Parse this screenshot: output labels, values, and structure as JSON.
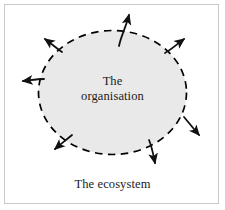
{
  "figure": {
    "name": "organisation-ecosystem-diagram",
    "background_color": "#ffffff",
    "frame_color": "#c9c9c9"
  },
  "organisation": {
    "label_line_1": "The",
    "label_line_2": "organisation",
    "fill_color": "#e9e9e9",
    "boundary_color": "#000000",
    "boundary_style": "dashed"
  },
  "ecosystem": {
    "label": "The ecosystem"
  },
  "arrows": {
    "color": "#111111",
    "count": 7,
    "items": [
      {
        "id": "arrow-top",
        "direction": "up"
      },
      {
        "id": "arrow-upper-left",
        "direction": "up-left"
      },
      {
        "id": "arrow-left",
        "direction": "left"
      },
      {
        "id": "arrow-upper-right",
        "direction": "up-right"
      },
      {
        "id": "arrow-lower-right",
        "direction": "down-right"
      },
      {
        "id": "arrow-bottom",
        "direction": "down"
      },
      {
        "id": "arrow-lower-left",
        "direction": "down-left"
      }
    ]
  }
}
